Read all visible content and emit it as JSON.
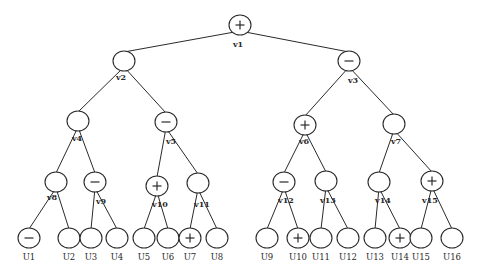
{
  "diagram": {
    "type": "binary-tree",
    "colors": {
      "line": "#2a2a2a",
      "background": "#ffffff"
    },
    "internal_nodes": [
      {
        "id": "v1",
        "label": "v1",
        "sign": "+",
        "x": 240,
        "y": 25,
        "lx": 238,
        "ly": 47
      },
      {
        "id": "v2",
        "label": "v2",
        "sign": "",
        "x": 124,
        "y": 61,
        "lx": 121,
        "ly": 80
      },
      {
        "id": "v3",
        "label": "v3",
        "sign": "-",
        "x": 349,
        "y": 61,
        "lx": 353,
        "ly": 83
      },
      {
        "id": "v4",
        "label": "v4",
        "sign": "",
        "x": 78,
        "y": 121,
        "lx": 77,
        "ly": 141
      },
      {
        "id": "v5",
        "label": "v5",
        "sign": "-",
        "x": 166,
        "y": 122,
        "lx": 171,
        "ly": 144
      },
      {
        "id": "v6",
        "label": "v6",
        "sign": "+",
        "x": 305,
        "y": 125,
        "lx": 304,
        "ly": 144
      },
      {
        "id": "v7",
        "label": "v7",
        "sign": "",
        "x": 394,
        "y": 124,
        "lx": 396,
        "ly": 144
      },
      {
        "id": "v8",
        "label": "v8",
        "sign": "",
        "x": 56,
        "y": 182,
        "lx": 52,
        "ly": 200
      },
      {
        "id": "v9",
        "label": "v9",
        "sign": "-",
        "x": 95,
        "y": 182,
        "lx": 101,
        "ly": 204
      },
      {
        "id": "v10",
        "label": "v10",
        "sign": "+",
        "x": 157,
        "y": 186,
        "lx": 160,
        "ly": 207
      },
      {
        "id": "v11",
        "label": "v11",
        "sign": "",
        "x": 198,
        "y": 183,
        "lx": 202,
        "ly": 207
      },
      {
        "id": "v12",
        "label": "v12",
        "sign": "-",
        "x": 284,
        "y": 182,
        "lx": 286,
        "ly": 203
      },
      {
        "id": "v13",
        "label": "v13",
        "sign": "",
        "x": 326,
        "y": 181,
        "lx": 328,
        "ly": 203
      },
      {
        "id": "v14",
        "label": "v14",
        "sign": "",
        "x": 379,
        "y": 182,
        "lx": 383,
        "ly": 203
      },
      {
        "id": "v15",
        "label": "v15",
        "sign": "+",
        "x": 432,
        "y": 181,
        "lx": 430,
        "ly": 203
      }
    ],
    "leaves": [
      {
        "id": "U1",
        "label": "U1",
        "sign": "-",
        "x": 29,
        "y": 238
      },
      {
        "id": "U2",
        "label": "U2",
        "sign": "",
        "x": 69,
        "y": 238
      },
      {
        "id": "U3",
        "label": "U3",
        "sign": "",
        "x": 91,
        "y": 238
      },
      {
        "id": "U4",
        "label": "U4",
        "sign": "",
        "x": 117,
        "y": 238
      },
      {
        "id": "U5",
        "label": "U5",
        "sign": "",
        "x": 144,
        "y": 238
      },
      {
        "id": "U6",
        "label": "U6",
        "sign": "",
        "x": 168,
        "y": 238
      },
      {
        "id": "U7",
        "label": "U7",
        "sign": "+",
        "x": 190,
        "y": 238
      },
      {
        "id": "U8",
        "label": "U8",
        "sign": "",
        "x": 217,
        "y": 238
      },
      {
        "id": "U9",
        "label": "U9",
        "sign": "",
        "x": 267,
        "y": 238
      },
      {
        "id": "U10",
        "label": "U10",
        "sign": "+",
        "x": 298,
        "y": 238
      },
      {
        "id": "U11",
        "label": "U11",
        "sign": "",
        "x": 321,
        "y": 238
      },
      {
        "id": "U12",
        "label": "U12",
        "sign": "",
        "x": 348,
        "y": 238
      },
      {
        "id": "U13",
        "label": "U13",
        "sign": "",
        "x": 375,
        "y": 238
      },
      {
        "id": "U14",
        "label": "U14",
        "sign": "+",
        "x": 400,
        "y": 238
      },
      {
        "id": "U15",
        "label": "U15",
        "sign": "",
        "x": 421,
        "y": 238
      },
      {
        "id": "U16",
        "label": "U16",
        "sign": "",
        "x": 452,
        "y": 238
      }
    ],
    "edges": [
      [
        "v1",
        "v2"
      ],
      [
        "v1",
        "v3"
      ],
      [
        "v2",
        "v4"
      ],
      [
        "v2",
        "v5"
      ],
      [
        "v3",
        "v6"
      ],
      [
        "v3",
        "v7"
      ],
      [
        "v4",
        "v8"
      ],
      [
        "v4",
        "v9"
      ],
      [
        "v5",
        "v10"
      ],
      [
        "v5",
        "v11"
      ],
      [
        "v6",
        "v12"
      ],
      [
        "v6",
        "v13"
      ],
      [
        "v7",
        "v14"
      ],
      [
        "v7",
        "v15"
      ],
      [
        "v8",
        "U1"
      ],
      [
        "v8",
        "U2"
      ],
      [
        "v9",
        "U3"
      ],
      [
        "v9",
        "U4"
      ],
      [
        "v10",
        "U5"
      ],
      [
        "v10",
        "U6"
      ],
      [
        "v11",
        "U7"
      ],
      [
        "v11",
        "U8"
      ],
      [
        "v12",
        "U9"
      ],
      [
        "v12",
        "U10"
      ],
      [
        "v13",
        "U11"
      ],
      [
        "v13",
        "U12"
      ],
      [
        "v14",
        "U13"
      ],
      [
        "v14",
        "U14"
      ],
      [
        "v15",
        "U15"
      ],
      [
        "v15",
        "U16"
      ]
    ],
    "node_radius": {
      "rx": 11,
      "ry": 10
    },
    "leaf_label_y": 260
  }
}
